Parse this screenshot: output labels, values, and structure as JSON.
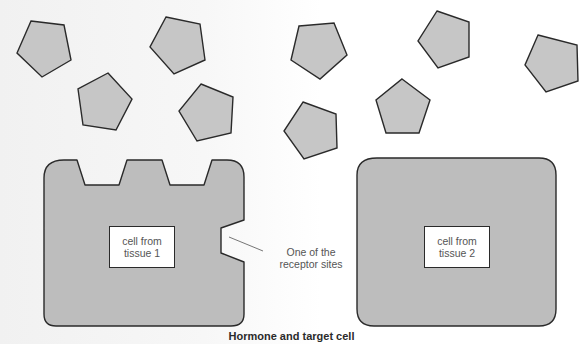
{
  "diagram": {
    "caption": "Hormone and target cell",
    "hormone_count": 10,
    "hormone_shape": "pentagon",
    "cells": [
      {
        "id": "cell-1",
        "nucleus_label": "cell from\ntissue 1",
        "receptor_sites": 4
      },
      {
        "id": "cell-2",
        "nucleus_label": "cell from\ntissue 2",
        "receptor_sites": 0
      }
    ],
    "annotation": {
      "text": "One of the\nreceptor sites"
    },
    "colors": {
      "hormone_fill": "#c6c6c6",
      "cell_fill": "#bdbdbd",
      "outline": "#2a2a2a",
      "label_text": "#555555"
    }
  }
}
